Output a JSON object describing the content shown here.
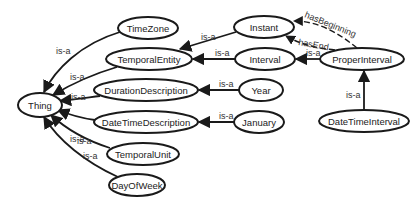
{
  "diagram": {
    "type": "ontology-graph",
    "nodes": [
      {
        "id": "Thing",
        "label": "Thing",
        "cx": 40,
        "cy": 105,
        "rx": 22,
        "ry": 12
      },
      {
        "id": "TimeZone",
        "label": "TimeZone",
        "cx": 148,
        "cy": 28,
        "rx": 30,
        "ry": 11
      },
      {
        "id": "TemporalEntity",
        "label": "TemporalEntity",
        "cx": 149,
        "cy": 59,
        "rx": 43,
        "ry": 11
      },
      {
        "id": "DurationDescription",
        "label": "DurationDescription",
        "cx": 146,
        "cy": 90,
        "rx": 52,
        "ry": 11
      },
      {
        "id": "DateTimeDescription",
        "label": "DateTimeDescription",
        "cx": 146,
        "cy": 122,
        "rx": 52,
        "ry": 11
      },
      {
        "id": "TemporalUnit",
        "label": "TemporalUnit",
        "cx": 143,
        "cy": 154,
        "rx": 36,
        "ry": 11
      },
      {
        "id": "DayOfWeek",
        "label": "DayOfWeek",
        "cx": 137,
        "cy": 185,
        "rx": 28,
        "ry": 11
      },
      {
        "id": "Instant",
        "label": "Instant",
        "cx": 264,
        "cy": 27,
        "rx": 30,
        "ry": 11
      },
      {
        "id": "Interval",
        "label": "Interval",
        "cx": 265,
        "cy": 59,
        "rx": 30,
        "ry": 11
      },
      {
        "id": "ProperInterval",
        "label": "ProperInterval",
        "cx": 362,
        "cy": 59,
        "rx": 42,
        "ry": 11
      },
      {
        "id": "Year",
        "label": "Year",
        "cx": 261,
        "cy": 90,
        "rx": 22,
        "ry": 11
      },
      {
        "id": "January",
        "label": "January",
        "cx": 259,
        "cy": 122,
        "rx": 25,
        "ry": 11
      },
      {
        "id": "DateTimeInterval",
        "label": "DateTimeInterval",
        "cx": 364,
        "cy": 121,
        "rx": 45,
        "ry": 11
      }
    ],
    "edges": [
      {
        "from": "TimeZone",
        "to": "Thing",
        "label": "is-a",
        "style": "solid"
      },
      {
        "from": "TemporalEntity",
        "to": "Thing",
        "label": "is-a",
        "style": "solid"
      },
      {
        "from": "DurationDescription",
        "to": "Thing",
        "label": "is-a",
        "style": "solid"
      },
      {
        "from": "DateTimeDescription",
        "to": "Thing",
        "label": "is-a",
        "style": "solid"
      },
      {
        "from": "TemporalUnit",
        "to": "Thing",
        "label": "is-a",
        "style": "solid"
      },
      {
        "from": "DayOfWeek",
        "to": "Thing",
        "label": "is-a",
        "style": "solid"
      },
      {
        "from": "Instant",
        "to": "TemporalEntity",
        "label": "is-a",
        "style": "solid"
      },
      {
        "from": "Interval",
        "to": "TemporalEntity",
        "label": "is-a",
        "style": "solid"
      },
      {
        "from": "ProperInterval",
        "to": "Interval",
        "label": "is-a",
        "style": "solid"
      },
      {
        "from": "ProperInterval",
        "to": "Instant",
        "label": "hasBeginning",
        "style": "dashed"
      },
      {
        "from": "ProperInterval",
        "to": "Instant",
        "label": "hasEnd",
        "style": "dashed"
      },
      {
        "from": "Year",
        "to": "DurationDescription",
        "label": "is-a",
        "style": "solid"
      },
      {
        "from": "January",
        "to": "DateTimeDescription",
        "label": "is-a",
        "style": "solid"
      },
      {
        "from": "DateTimeInterval",
        "to": "ProperInterval",
        "label": "is-a",
        "style": "solid"
      }
    ]
  },
  "labels": {
    "is_a": "is-a",
    "has_beginning": "hasBeginning",
    "has_end": "hasEnd"
  },
  "colors": {
    "stroke": "#1a1a1a",
    "fill": "#ffffff",
    "text": "#222222"
  }
}
